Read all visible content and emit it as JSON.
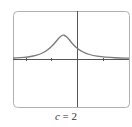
{
  "chart_data": {
    "type": "line",
    "title": "",
    "caption_var": "c",
    "caption_eq": " = 2",
    "xlabel": "",
    "ylabel": "",
    "grid": false,
    "frame": {
      "x": 13,
      "y": 11,
      "w": 116,
      "h": 96,
      "radius": 4,
      "color": "#b0b0b0"
    },
    "axes_origin_px": {
      "x": 77,
      "y": 59
    },
    "x_ticks_px": [
      26,
      51,
      103
    ],
    "series": [
      {
        "name": "f(x), c = 2",
        "color": "#7a7a7a",
        "points_px": [
          [
            13,
            58
          ],
          [
            20,
            57.6
          ],
          [
            28,
            57
          ],
          [
            36,
            55.5
          ],
          [
            43,
            53
          ],
          [
            49,
            49
          ],
          [
            54,
            44
          ],
          [
            58,
            39
          ],
          [
            61,
            36
          ],
          [
            63,
            35
          ],
          [
            65,
            35.5
          ],
          [
            68,
            38
          ],
          [
            71,
            42
          ],
          [
            75,
            46.5
          ],
          [
            80,
            50.5
          ],
          [
            86,
            53.5
          ],
          [
            93,
            55.5
          ],
          [
            101,
            56.8
          ],
          [
            110,
            57.5
          ],
          [
            120,
            58
          ],
          [
            129,
            58.2
          ]
        ]
      }
    ]
  }
}
